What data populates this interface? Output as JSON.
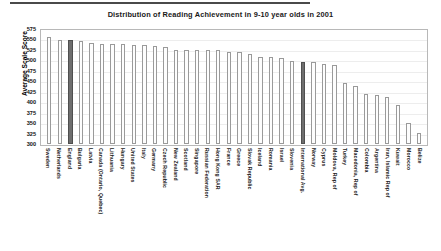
{
  "chart_data": {
    "type": "bar",
    "title": "Distribution of Reading Achievement in 9-10 year olds in 2001",
    "xlabel": "",
    "ylabel": "Average Scale Score",
    "ylim": [
      300,
      575
    ],
    "ytick_step": 25,
    "yticks": [
      575,
      550,
      525,
      500,
      475,
      450,
      425,
      400,
      375,
      350,
      325,
      300
    ],
    "grid": true,
    "legend": "none",
    "bar_fill_color": "#fdfdfd",
    "bar_edge_color": "#9a9a9a",
    "highlight_color": "#6e6e6e",
    "highlighted_categories": [
      "England",
      "International Avg."
    ],
    "categories": [
      "Sweden",
      "Netherlands",
      "England",
      "Bulgaria",
      "Latvia",
      "Canada (Ontario, Quebec)",
      "Lithuania",
      "Hungary",
      "United States",
      "Italy",
      "Germany",
      "Czech Republic",
      "New Zealand",
      "Scotland",
      "Singapore",
      "Russian Federation",
      "Hong Kong SAR",
      "France",
      "Greece",
      "Slovak Republic",
      "Iceland",
      "Romania",
      "Israel",
      "Slovenia",
      "International Avg.",
      "Norway",
      "Cyprus",
      "Moldova, Rep of",
      "Turkey",
      "Macedonia, Rep of",
      "Colombia",
      "Argentina",
      "Iran, Islamic Rep of",
      "Kuwait",
      "Morocco",
      "Belize"
    ],
    "values": [
      561,
      554,
      553,
      550,
      545,
      544,
      543,
      543,
      542,
      541,
      539,
      537,
      529,
      528,
      528,
      528,
      528,
      525,
      524,
      518,
      512,
      512,
      509,
      502,
      500,
      499,
      494,
      492,
      449,
      442,
      422,
      420,
      414,
      396,
      350,
      327
    ]
  }
}
